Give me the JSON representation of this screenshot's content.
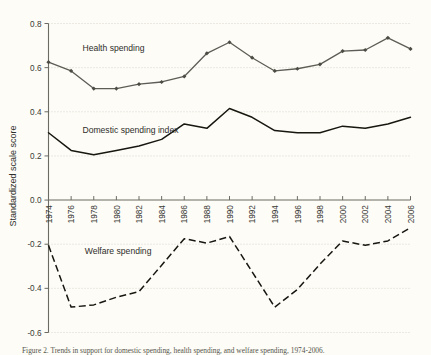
{
  "figure": {
    "background_color": "#fdfcf7",
    "caption": "Figure 2. Trends in support for domestic spending, health spending, and welfare spending, 1974-2006."
  },
  "chart_data": {
    "type": "line",
    "title": "",
    "xlabel": "",
    "ylabel": "Standardized scale score",
    "xlim": [
      1974,
      2006
    ],
    "ylim": [
      -0.6,
      0.8
    ],
    "yticks": [
      0.8,
      0.6,
      0.4,
      0.2,
      0.0,
      -0.2,
      -0.4,
      -0.6
    ],
    "ytick_labels": [
      "0.8",
      "0.6",
      "0.4",
      "0.2",
      "0.0",
      "-0.2",
      "-0.4",
      "-0.6"
    ],
    "xticks": [
      1974,
      1976,
      1978,
      1980,
      1982,
      1984,
      1986,
      1988,
      1990,
      1992,
      1994,
      1996,
      1998,
      2000,
      2002,
      2004,
      2006
    ],
    "xtick_labels": [
      "1974",
      "1976",
      "1978",
      "1980",
      "1982",
      "1984",
      "1986",
      "1988",
      "1990",
      "1992",
      "1994",
      "1996",
      "1998",
      "2000",
      "2002",
      "2004",
      "2006"
    ],
    "grid": true,
    "grid_axis": "y",
    "legend_position": "inline-annotations",
    "x": [
      1974,
      1976,
      1978,
      1980,
      1982,
      1984,
      1986,
      1988,
      1990,
      1992,
      1994,
      1996,
      1998,
      2000,
      2002,
      2004,
      2006
    ],
    "series": [
      {
        "name": "Health spending",
        "label_x": 1977.0,
        "label_y": 0.675,
        "style": "solid-with-markers",
        "color": "#5d5d55",
        "markers": true,
        "values": [
          0.625,
          0.585,
          0.505,
          0.505,
          0.525,
          0.535,
          0.56,
          0.665,
          0.715,
          0.645,
          0.585,
          0.595,
          0.615,
          0.675,
          0.68,
          0.735,
          0.685
        ]
      },
      {
        "name": "Domestic spending index",
        "label_x": 1977.0,
        "label_y": 0.305,
        "style": "solid",
        "color": "#17170f",
        "markers": false,
        "values": [
          0.305,
          0.225,
          0.205,
          0.225,
          0.245,
          0.275,
          0.345,
          0.325,
          0.415,
          0.375,
          0.315,
          0.305,
          0.305,
          0.335,
          0.325,
          0.345,
          0.375
        ]
      },
      {
        "name": "Welfare spending",
        "label_x": 1977.2,
        "label_y": -0.245,
        "style": "dashed",
        "color": "#17170f",
        "markers": false,
        "values": [
          -0.205,
          -0.485,
          -0.475,
          -0.44,
          -0.415,
          -0.295,
          -0.175,
          -0.195,
          -0.165,
          -0.325,
          -0.485,
          -0.405,
          -0.29,
          -0.185,
          -0.205,
          -0.185,
          -0.125
        ]
      }
    ]
  }
}
